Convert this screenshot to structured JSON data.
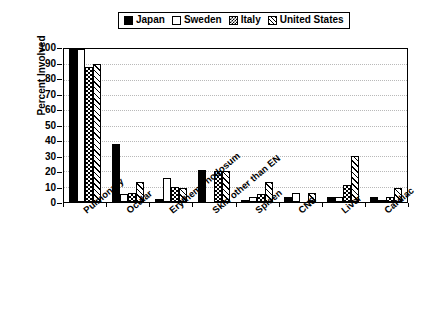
{
  "chart_data": {
    "type": "bar",
    "title": "",
    "xlabel": "",
    "ylabel": "Percent Involved",
    "ylim": [
      0,
      100
    ],
    "yticks": [
      0,
      10,
      20,
      30,
      40,
      50,
      60,
      70,
      80,
      90,
      100
    ],
    "grid": true,
    "legend_position": "top",
    "categories": [
      "Pulmonary",
      "Ocular",
      "Erythema nodosum",
      "Skin other than EN",
      "Spleen",
      "CNS",
      "Liver",
      "Cardiac"
    ],
    "series": [
      {
        "name": "Japan",
        "fill": "solid-black",
        "values": [
          100,
          38,
          2,
          21,
          1,
          3,
          3,
          3
        ]
      },
      {
        "name": "Sweden",
        "fill": "white",
        "values": [
          100,
          5,
          16,
          0,
          3,
          6,
          3,
          1
        ]
      },
      {
        "name": "Italy",
        "fill": "cross-hatch",
        "values": [
          88,
          6,
          10,
          20,
          5,
          0,
          11,
          3
        ]
      },
      {
        "name": "United States",
        "fill": "diagonal-hatch",
        "values": [
          90,
          13,
          9,
          20,
          13,
          6,
          30,
          9
        ]
      }
    ]
  },
  "legend": {
    "items": [
      {
        "label": "Japan",
        "swatch": "solid-black"
      },
      {
        "label": "Sweden",
        "swatch": "white"
      },
      {
        "label": "Italy",
        "swatch": "cross-hatch"
      },
      {
        "label": "United States",
        "swatch": "diagonal-hatch"
      }
    ]
  },
  "axes": {
    "y": {
      "label": "Percent Involved",
      "ticks": [
        "100",
        "90",
        "80",
        "70",
        "60",
        "50",
        "40",
        "30",
        "20",
        "10",
        "0"
      ]
    },
    "x": {
      "ticks": [
        "Pulmonary",
        "Ocular",
        "Erythema nodosum",
        "Skin other than EN",
        "Spleen",
        "CNS",
        "Liver",
        "Cardiac"
      ]
    }
  }
}
